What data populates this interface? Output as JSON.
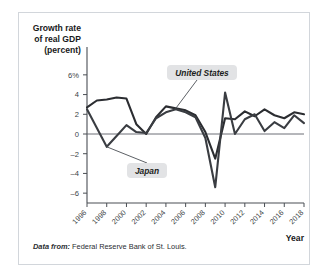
{
  "figure": {
    "source_note_lead": "Data from:",
    "source_note_text": "Federal Reserve Bank of St. Louis."
  },
  "chart_data": {
    "type": "line",
    "title": "",
    "ylabel_lines": [
      "Growth rate",
      "of real GDP",
      "(percent)"
    ],
    "xlabel": "Year",
    "ylim": [
      -7,
      7
    ],
    "xlim": [
      1996,
      2018
    ],
    "grid": false,
    "zero_line": true,
    "legend_position": "annotated-callouts",
    "ytick_labels": [
      "6%",
      "4",
      "2",
      "0",
      "-2",
      "-4",
      "-6"
    ],
    "ytick_values": [
      6,
      4,
      2,
      0,
      -2,
      -4,
      -6
    ],
    "xtick_labels": [
      "1996",
      "1998",
      "2000",
      "2002",
      "2004",
      "2006",
      "2008",
      "2010",
      "2012",
      "2014",
      "2016",
      "2018"
    ],
    "xtick_values": [
      1996,
      1998,
      2000,
      2002,
      2004,
      2006,
      2008,
      2010,
      2012,
      2014,
      2016,
      2018
    ],
    "x": [
      1996,
      1997,
      1998,
      1999,
      2000,
      2001,
      2002,
      2003,
      2004,
      2005,
      2006,
      2007,
      2008,
      2009,
      2010,
      2011,
      2012,
      2013,
      2014,
      2015,
      2016,
      2017,
      2018
    ],
    "series": [
      {
        "name": "United States",
        "color": "#2b2d31",
        "values": [
          2.7,
          3.4,
          3.5,
          3.7,
          3.6,
          1.0,
          0.0,
          1.7,
          2.8,
          2.6,
          2.4,
          1.9,
          0.2,
          -2.5,
          1.6,
          1.5,
          2.3,
          1.8,
          2.5,
          1.9,
          1.6,
          2.2,
          2.0
        ]
      },
      {
        "name": "Japan",
        "color": "#3a3d42",
        "values": [
          2.5,
          0.6,
          -1.3,
          -0.2,
          0.9,
          0.2,
          0.1,
          1.6,
          2.2,
          2.5,
          2.2,
          1.7,
          -0.4,
          -5.4,
          4.2,
          0.0,
          1.5,
          2.0,
          0.3,
          1.2,
          0.6,
          1.9,
          1.1
        ]
      }
    ],
    "annotations": [
      {
        "name": "United States",
        "label": "United States",
        "points_to_year": 2005,
        "points_to_value": 2.6
      },
      {
        "name": "Japan",
        "label": "Japan",
        "points_to_year": 1998,
        "points_to_value": -1.3
      }
    ]
  }
}
